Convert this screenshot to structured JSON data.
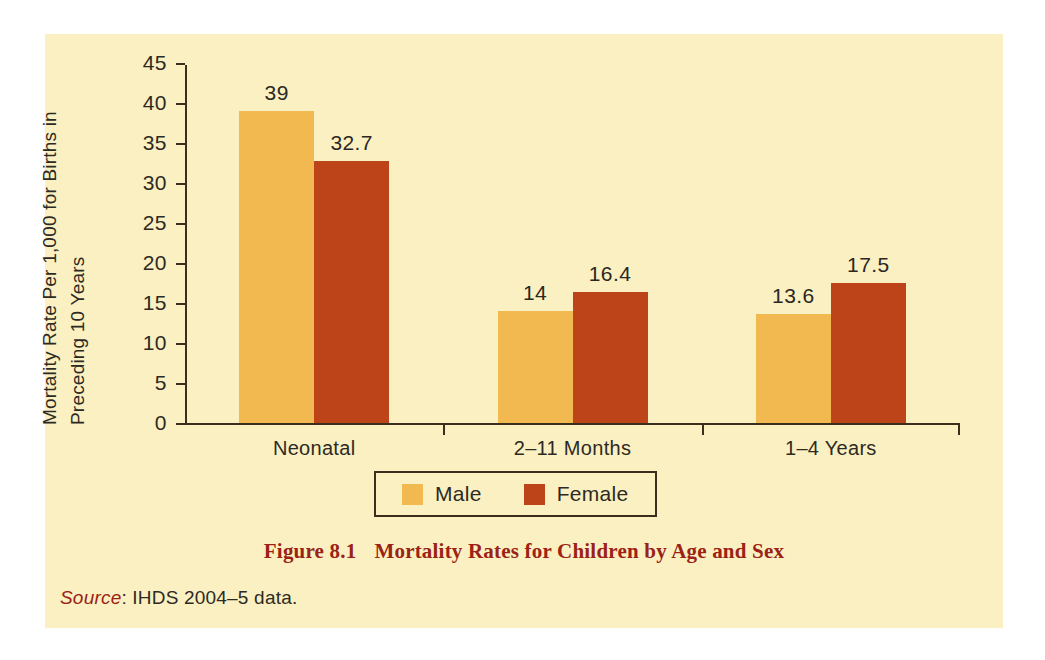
{
  "figure": {
    "caption_number": "Figure 8.1",
    "caption_text": "Mortality Rates for Children by Age and Sex",
    "source_word": "Source",
    "source_text": ": IHDS 2004–5 data.",
    "background_color": "#FAF0C2",
    "caption_color": "#9B2215"
  },
  "chart_data": {
    "type": "bar",
    "title": "Mortality Rates for Children by Age and Sex",
    "xlabel": "",
    "ylabel": "Mortality Rate Per 1,000 for Births in Preceding 10 Years",
    "ylabel_line1": "Mortality Rate Per 1,000 for Births in",
    "ylabel_line2": "Preceding 10 Years",
    "categories": [
      "Neonatal",
      "2–11 Months",
      "1–4 Years"
    ],
    "series": [
      {
        "name": "Male",
        "color": "#F2B951",
        "values": [
          39,
          14,
          13.6
        ],
        "labels": [
          "39",
          "14",
          "13.6"
        ]
      },
      {
        "name": "Female",
        "color": "#BC4418",
        "values": [
          32.7,
          16.4,
          17.5
        ],
        "labels": [
          "32.7",
          "16.4",
          "17.5"
        ]
      }
    ],
    "ylim": [
      0,
      45
    ],
    "yticks": [
      0,
      5,
      10,
      15,
      20,
      25,
      30,
      35,
      40,
      45
    ],
    "ytick_labels": [
      "0",
      "5",
      "10",
      "15",
      "20",
      "25",
      "30",
      "35",
      "40",
      "45"
    ],
    "grid": false,
    "legend_position": "bottom",
    "legend_entries": [
      {
        "label": "Male",
        "color": "#F2B951"
      },
      {
        "label": "Female",
        "color": "#BC4418"
      }
    ]
  }
}
